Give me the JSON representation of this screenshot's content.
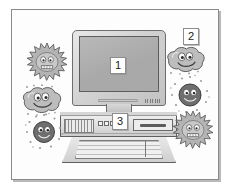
{
  "illustration": {
    "title": "Computer with germs illustration",
    "description": "Grayscale clip-art of a desktop computer surrounded by cartoon germ characters",
    "frame": {
      "border_color": "#8a8a8a",
      "background_color": "#ffffff"
    }
  },
  "callouts": [
    {
      "id": "callout-1",
      "number": "1",
      "points_to": "monitor-screen"
    },
    {
      "id": "callout-2",
      "number": "2",
      "points_to": "germ-blob-top-right"
    },
    {
      "id": "callout-3",
      "number": "3",
      "points_to": "tower-base-unit"
    }
  ],
  "computer": {
    "monitor": {
      "name": "CRT/LCD monitor",
      "screen_color": "#a9a9a9",
      "case_color": "#d2d2d2"
    },
    "tower": {
      "name": "Base unit / system tower",
      "case_color": "#e0e0e0",
      "button_count": 3
    },
    "keyboard": {
      "name": "Keyboard",
      "case_color": "#cfcfcf"
    }
  },
  "germs": [
    {
      "id": "germ-spiky-top-left",
      "shape": "spiky-virus",
      "has_face": true,
      "position": "top-left"
    },
    {
      "id": "germ-blob-left",
      "shape": "blob-amoeba",
      "has_face": true,
      "position": "mid-left"
    },
    {
      "id": "germ-round-bottom-left",
      "shape": "round-dotted",
      "has_face": true,
      "position": "bottom-left"
    },
    {
      "id": "germ-blob-top-right",
      "shape": "blob-amoeba",
      "has_face": true,
      "position": "top-right"
    },
    {
      "id": "germ-round-right",
      "shape": "round-dotted",
      "has_face": true,
      "position": "mid-right"
    },
    {
      "id": "germ-spiky-bottom-right",
      "shape": "spiky-virus",
      "has_face": true,
      "position": "bottom-right"
    }
  ],
  "colors": {
    "germ_fill": "#b2b2b2",
    "germ_dark_fill": "#6f6f6f",
    "outline": "#4a4a4a"
  }
}
